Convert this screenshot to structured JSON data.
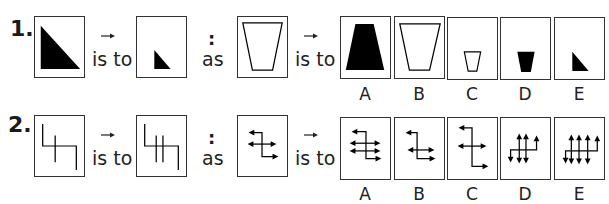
{
  "questions": [
    {
      "number": "1.",
      "connector_is_to_1": "is to",
      "connector_colon": ":",
      "connector_as": "as",
      "connector_is_to_2": "is to",
      "stem": {
        "first": "large black right triangle",
        "second": "small black right triangle",
        "third": "large white inverted trapezoid"
      },
      "options": [
        {
          "label": "A",
          "figure": "large black trapezoid"
        },
        {
          "label": "B",
          "figure": "large white inverted trapezoid"
        },
        {
          "label": "C",
          "figure": "small white inverted trapezoid"
        },
        {
          "label": "D",
          "figure": "small black inverted trapezoid"
        },
        {
          "label": "E",
          "figure": "small black right triangle"
        }
      ]
    },
    {
      "number": "2.",
      "connector_is_to_1": "is to",
      "connector_colon": ":",
      "connector_as": "as",
      "connector_is_to_2": "is to",
      "stem": {
        "first": "zigzag line with one vertical crossing line",
        "second": "zigzag line with two vertical crossing lines",
        "third": "zigzag arrow path with one horizontal double arrow"
      },
      "options": [
        {
          "label": "A",
          "figure": "zigzag arrow path with two horizontal double arrows"
        },
        {
          "label": "B",
          "figure": "zigzag arrow path with one horizontal double arrow (shifted)"
        },
        {
          "label": "C",
          "figure": "long zigzag arrow path with one horizontal double arrow"
        },
        {
          "label": "D",
          "figure": "rotated zigzag with two vertical double arrows"
        },
        {
          "label": "E",
          "figure": "rotated zigzag with three vertical double arrows"
        }
      ]
    }
  ]
}
